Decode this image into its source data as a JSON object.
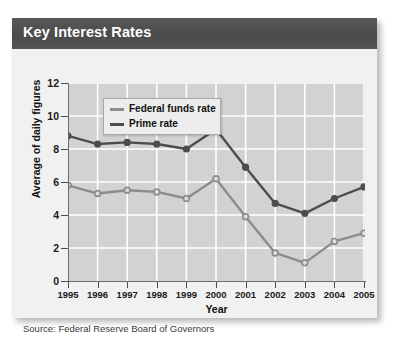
{
  "card": {
    "header_title": "Key Interest Rates",
    "source_text": "Source: Federal Reserve Board of Governors",
    "header_bg": "#4f4f4f",
    "card_bg": "#f1f1f1",
    "plot_bg": "#d2d2d2",
    "gridline_color": "#ffffff"
  },
  "chart_data": {
    "type": "line",
    "title": "Key Interest Rates",
    "xlabel": "Year",
    "ylabel": "Average of daily figures",
    "x": [
      1995,
      1996,
      1997,
      1998,
      1999,
      2000,
      2001,
      2002,
      2003,
      2004,
      2005
    ],
    "categories": [
      "1995",
      "1996",
      "1997",
      "1998",
      "1999",
      "2000",
      "2001",
      "2002",
      "2003",
      "2004",
      "2005"
    ],
    "xlim": [
      1994.5,
      2005.5
    ],
    "ylim": [
      0,
      12
    ],
    "yticks": [
      0,
      2,
      4,
      6,
      8,
      10,
      12
    ],
    "ytick_labels": [
      "0",
      "2",
      "4",
      "6",
      "8",
      "10",
      "12"
    ],
    "grid": true,
    "grid_axis": "both",
    "legend_position": "upper-left-inside",
    "series": [
      {
        "name": "Federal funds rate",
        "color": "#8c8c8c",
        "marker": "open-circle",
        "marker_fill": "#dcdcdc",
        "values": [
          5.8,
          5.3,
          5.5,
          5.4,
          5.0,
          6.2,
          3.9,
          1.7,
          1.1,
          2.4,
          2.9
        ]
      },
      {
        "name": "Prime rate",
        "color": "#4d4d4d",
        "marker": "filled-circle",
        "marker_fill": "#4d4d4d",
        "values": [
          8.8,
          8.3,
          8.4,
          8.3,
          8.0,
          9.2,
          6.9,
          4.7,
          4.1,
          5.0,
          5.7
        ]
      }
    ]
  }
}
